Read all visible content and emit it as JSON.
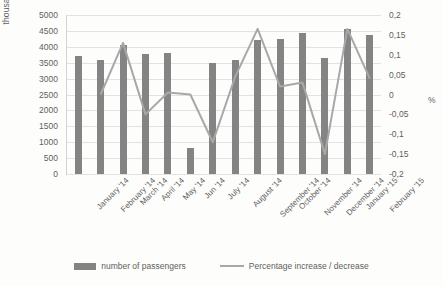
{
  "chart_data": {
    "type": "bar",
    "title": "",
    "subtitle": "",
    "xlabel": "",
    "ylabel": "thousand person",
    "y2label": "%",
    "ylim": [
      0,
      5000
    ],
    "y2lim": [
      -0.2,
      0.2
    ],
    "yticks": [
      "5000",
      "4500",
      "4000",
      "3500",
      "3000",
      "2500",
      "2000",
      "1500",
      "1000",
      "500",
      "0"
    ],
    "y2ticks": [
      "0,2",
      "0,15",
      "0,1",
      "0,05",
      "0",
      "-0,05",
      "-0,1",
      "-0,15",
      "-0,2"
    ],
    "grid": true,
    "legend_position": "bottom",
    "categories": [
      "January '14",
      "February '14",
      "March '14",
      "April '14",
      "May '14",
      "Jun '14",
      "July '14",
      "August '14",
      "September '14",
      "October '14",
      "November '14",
      "December '14",
      "January '15",
      "February '15"
    ],
    "series": [
      {
        "name": "number of passengers",
        "type": "bar",
        "axis": "left",
        "color": "#848484",
        "values": [
          3700,
          3580,
          4070,
          3760,
          3820,
          830,
          3490,
          3580,
          4200,
          4260,
          4450,
          3660,
          4560,
          4370
        ]
      },
      {
        "name": "Percentage increase / decrease",
        "type": "line",
        "axis": "right",
        "color": "#a8a8a8",
        "values": [
          null,
          0.0,
          0.13,
          -0.05,
          0.005,
          0.0,
          -0.12,
          0.045,
          0.165,
          0.02,
          0.03,
          -0.15,
          0.165,
          0.04
        ]
      }
    ]
  },
  "legend": {
    "items": [
      {
        "label": "number of passengers",
        "swatch": "bar"
      },
      {
        "label": "Percentage increase / decrease",
        "swatch": "line"
      }
    ]
  }
}
